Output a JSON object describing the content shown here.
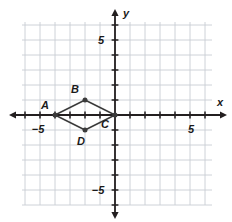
{
  "figure": {
    "name": "coordinate-plane-rhombus",
    "page_artifact_text": "188"
  },
  "chart_data": {
    "type": "scatter",
    "title": "",
    "xlabel": "x",
    "ylabel": "y",
    "xlim": [
      -6,
      6
    ],
    "ylim": [
      -6,
      6
    ],
    "grid": true,
    "grid_step": 1,
    "legend": "none",
    "axis_labels": {
      "x_axis_name": "x",
      "y_axis_name": "y"
    },
    "x_ticks": [
      -5,
      5
    ],
    "y_ticks": [
      5,
      -5
    ],
    "x_tick_labels": [
      "−5",
      "5"
    ],
    "y_tick_labels": [
      "5",
      "−5"
    ],
    "shapes": [
      {
        "name": "rhombus-ABCD",
        "type": "polygon",
        "closed": true,
        "vertices": [
          {
            "label": "A",
            "x": -4,
            "y": 0
          },
          {
            "label": "B",
            "x": -2,
            "y": 1
          },
          {
            "label": "C",
            "x": 0,
            "y": 0
          },
          {
            "label": "D",
            "x": -2,
            "y": -1
          }
        ]
      }
    ],
    "points": [
      {
        "label": "A",
        "x": -4,
        "y": 0,
        "label_dx": -10,
        "label_dy": -6
      },
      {
        "label": "B",
        "x": -2,
        "y": 1,
        "label_dx": -10,
        "label_dy": -7
      },
      {
        "label": "C",
        "x": 0,
        "y": 0,
        "label_dx": -10,
        "label_dy": 13
      },
      {
        "label": "D",
        "x": -2,
        "y": -1,
        "label_dx": -4,
        "label_dy": 15
      }
    ]
  },
  "colors": {
    "grid_line": "#c8cdd4",
    "axis_line": "#231f20",
    "shape_stroke": "#3b3b3b",
    "vertex_fill": "#3b3b3b",
    "text": "#1a1a1a",
    "background": "#ffffff"
  },
  "geometry": {
    "origin_x": 115,
    "origin_y": 115,
    "unit_px": 15,
    "grid_left": 22,
    "grid_right": 212,
    "grid_top": 22,
    "grid_bottom": 205,
    "axis_x_start": 14,
    "axis_x_end": 222,
    "axis_y_start": 14,
    "axis_y_end": 214
  },
  "labels": {
    "x_neg5": "−5",
    "x_pos5": "5",
    "y_pos5": "5",
    "y_neg5": "−5",
    "axis_x": "x",
    "axis_y": "y",
    "vertex_a": "A",
    "vertex_b": "B",
    "vertex_c": "C",
    "vertex_d": "D"
  }
}
